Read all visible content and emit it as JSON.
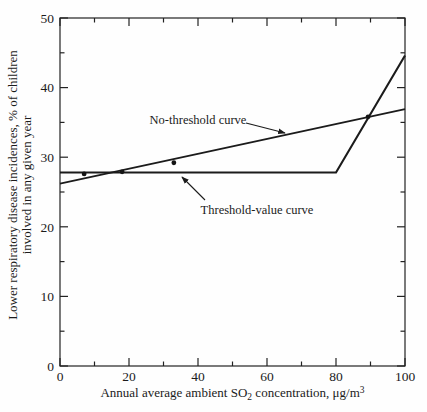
{
  "figure": {
    "background": "#fefefe",
    "line_color": "#1b1b1b",
    "text_color": "#1b1b1b"
  },
  "chart_data": {
    "type": "line",
    "title": "",
    "xlabel": {
      "pre": "Annual average ambient SO",
      "sub": "2",
      "mid": " concentration, μg/m",
      "sup": "3"
    },
    "ylabel_lines": [
      "Lower respiratory disease incidences, % of children",
      "involved in any given year"
    ],
    "xlim": [
      0,
      100
    ],
    "ylim": [
      0,
      50
    ],
    "x_major_ticks": [
      0,
      20,
      40,
      60,
      80,
      100
    ],
    "x_minor_ticks": [
      10,
      30,
      50,
      70,
      90
    ],
    "y_major_ticks": [
      0,
      10,
      20,
      30,
      40,
      50
    ],
    "y_minor_ticks": [
      5,
      15,
      25,
      35,
      45
    ],
    "grid": false,
    "legend_position": "none",
    "series": [
      {
        "name": "No-threshold curve",
        "points": [
          [
            0,
            26.2
          ],
          [
            100,
            36.9
          ]
        ],
        "stroke_width": 1.7
      },
      {
        "name": "Threshold-value curve",
        "points": [
          [
            0,
            27.8
          ],
          [
            80,
            27.8
          ],
          [
            100,
            44.6
          ]
        ],
        "stroke_width": 2.1
      }
    ],
    "scatter_points": [
      [
        7,
        27.6
      ],
      [
        18,
        27.9
      ],
      [
        33,
        29.2
      ],
      [
        89.3,
        35.8
      ]
    ],
    "annotations": [
      {
        "text": "No-threshold curve",
        "tx": 198,
        "ty": 124,
        "arrow": [
          246,
          123,
          285,
          133
        ]
      },
      {
        "text": "Threshold-value curve",
        "tx": 257,
        "ty": 214,
        "arrow": [
          205,
          200,
          182,
          177
        ]
      }
    ]
  }
}
